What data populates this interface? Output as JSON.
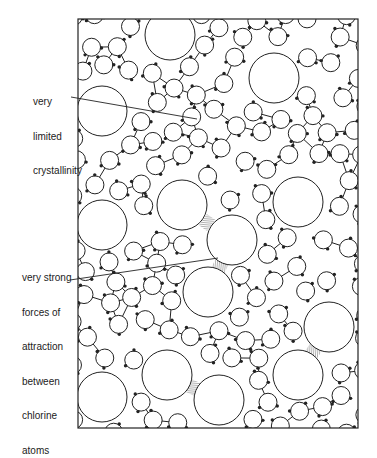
{
  "labels": {
    "crystallinity": {
      "lines": [
        "very",
        "limited",
        "crystallinity"
      ]
    },
    "attraction": {
      "lines": [
        "very strong",
        "forces of",
        "attraction",
        "between",
        "chlorine",
        "atoms"
      ]
    }
  },
  "colors": {
    "stroke": "#222222",
    "background": "#ffffff"
  }
}
